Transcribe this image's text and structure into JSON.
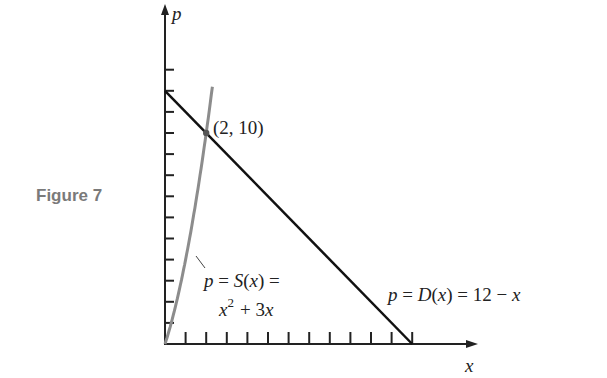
{
  "figure_label": "Figure 7",
  "chart_data": {
    "type": "line",
    "title": "",
    "xlabel": "x",
    "ylabel": "p",
    "xlim": [
      0,
      12
    ],
    "ylim": [
      0,
      12
    ],
    "x_ticks": [
      1,
      2,
      3,
      4,
      5,
      6,
      7,
      8,
      9,
      10,
      11,
      12
    ],
    "y_ticks": [
      1,
      2,
      3,
      4,
      5,
      6,
      7,
      8,
      9,
      10,
      11,
      12,
      13
    ],
    "series": [
      {
        "name": "p = S(x) = x^2 + 3x",
        "color": "#8c8c8c",
        "x": [
          0,
          0.5,
          1,
          1.5,
          2,
          2.3
        ],
        "y": [
          0,
          1.75,
          4,
          6.75,
          10,
          12.19
        ]
      },
      {
        "name": "p = D(x) = 12 - x",
        "color": "#111111",
        "x": [
          0,
          12
        ],
        "y": [
          12,
          0
        ]
      }
    ],
    "annotations": [
      {
        "text": "(2, 10)",
        "x": 2,
        "y": 10
      }
    ]
  },
  "labels": {
    "axis_x": "x",
    "axis_y": "p",
    "point": "(2, 10)",
    "supply_line1": "p = S(x) =",
    "supply_line2_base": "x",
    "supply_line2_exp": "2",
    "supply_line2_rest": "+ 3x",
    "demand": "p = D(x) = 12 − x"
  }
}
